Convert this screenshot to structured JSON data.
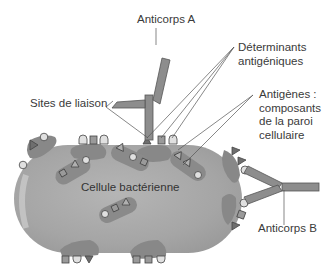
{
  "labels": {
    "antibody_a": "Anticorps A",
    "antibody_b": "Anticorps B",
    "determinants_line1": "Déterminants",
    "determinants_line2": "antigéniques",
    "binding_sites": "Sites de liaison",
    "antigens_line1": "Antigènes :",
    "antigens_line2": "composants",
    "antigens_line3": "de la paroi",
    "antigens_line4": "cellulaire",
    "cell": "Cellule bactérienne"
  },
  "colors": {
    "cell_body": "#a9a9a9",
    "cell_highlight": "#c4c4c4",
    "wall_patch": "#888888",
    "antibody": "#8d8d8d",
    "determinant_square": "#9a9a9a",
    "determinant_circle": "#d9d9d9",
    "determinant_triangle": "#6e6e6e",
    "text": "#3a3a3a"
  }
}
